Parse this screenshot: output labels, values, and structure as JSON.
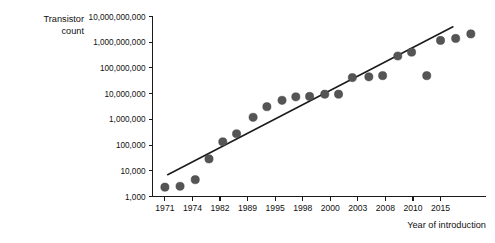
{
  "chart_data": {
    "type": "scatter",
    "title": "",
    "ylabel_line1": "Transistor",
    "ylabel_line2": "count",
    "xlabel": "Year of introduction",
    "y_scale": "log",
    "ylim": [
      1000,
      10000000000
    ],
    "y_tick_labels": [
      "1,000",
      "10,000",
      "100,000",
      "1,000,000",
      "10,000,000",
      "100,000,000",
      "1,000,000,000",
      "10,000,000,000"
    ],
    "y_tick_values": [
      1000,
      10000,
      100000,
      1000000,
      10000000,
      100000000,
      1000000000,
      10000000000
    ],
    "x_tick_labels": [
      "1971",
      "1974",
      "1982",
      "1989",
      "1995",
      "1998",
      "2000",
      "2003",
      "2008",
      "2010",
      "2015"
    ],
    "x_tick_positions": [
      0,
      2,
      4,
      6,
      8,
      10,
      12,
      14,
      16,
      18,
      20
    ],
    "grid": false,
    "legend": "none",
    "point_color": "#555555",
    "line_color": "#1a1a1a",
    "series": [
      {
        "name": "Transistor count",
        "points": [
          {
            "x": 0.0,
            "y": 2300
          },
          {
            "x": 1.1,
            "y": 2500
          },
          {
            "x": 2.2,
            "y": 4500
          },
          {
            "x": 3.2,
            "y": 29000
          },
          {
            "x": 4.2,
            "y": 134000
          },
          {
            "x": 5.2,
            "y": 275000
          },
          {
            "x": 6.4,
            "y": 1200000
          },
          {
            "x": 7.4,
            "y": 3100000
          },
          {
            "x": 8.5,
            "y": 5500000
          },
          {
            "x": 9.5,
            "y": 7500000
          },
          {
            "x": 10.5,
            "y": 7800000
          },
          {
            "x": 11.6,
            "y": 9500000
          },
          {
            "x": 12.6,
            "y": 9500000
          },
          {
            "x": 13.6,
            "y": 42000000
          },
          {
            "x": 14.8,
            "y": 45000000
          },
          {
            "x": 15.8,
            "y": 50000000
          },
          {
            "x": 16.9,
            "y": 291000000
          },
          {
            "x": 17.9,
            "y": 410000000
          },
          {
            "x": 19.0,
            "y": 50000000
          },
          {
            "x": 20.0,
            "y": 1170000000
          },
          {
            "x": 21.1,
            "y": 1400000000
          },
          {
            "x": 22.2,
            "y": 2100000000
          }
        ]
      }
    ],
    "trend_line": {
      "name": "Moore's law fit",
      "x_start": 0.2,
      "y_start": 7000,
      "x_end": 20.9,
      "y_end": 4000000000
    }
  }
}
